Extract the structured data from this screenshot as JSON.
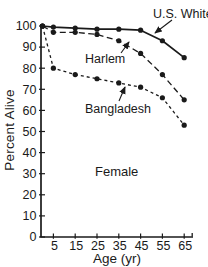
{
  "chart_data": {
    "type": "line",
    "title": "",
    "xlabel": "Age (yr)",
    "ylabel": "Percent Alive",
    "center_label": "Female",
    "ink_color": "#1a1a1a",
    "background_color": "#ffffff",
    "grid": false,
    "legend": "inline-arrow-annotations",
    "xlim": [
      0,
      69
    ],
    "ylim": [
      0,
      100
    ],
    "x": [
      0,
      5,
      15,
      25,
      35,
      45,
      55,
      65
    ],
    "xticks": [
      "5",
      "15",
      "25",
      "35",
      "45",
      "55",
      "65"
    ],
    "yticks": [
      "0",
      "10",
      "20",
      "30",
      "40",
      "50",
      "60",
      "70",
      "80",
      "90",
      "100"
    ],
    "series": [
      {
        "name": "U.S. White",
        "line_style": "solid",
        "dash": "",
        "color": "#1a1a1a",
        "values": [
          100,
          99.5,
          99,
          98.5,
          98.5,
          98,
          93,
          85
        ]
      },
      {
        "name": "Harlem",
        "line_style": "dashed",
        "dash": "6 3.5",
        "color": "#1a1a1a",
        "values": [
          100,
          97,
          97,
          96,
          93,
          87,
          77,
          65
        ]
      },
      {
        "name": "Bangladesh",
        "line_style": "dashed",
        "dash": "3 3",
        "color": "#1a1a1a",
        "values": [
          100,
          80,
          77,
          75,
          73,
          71,
          66,
          53
        ]
      }
    ]
  }
}
